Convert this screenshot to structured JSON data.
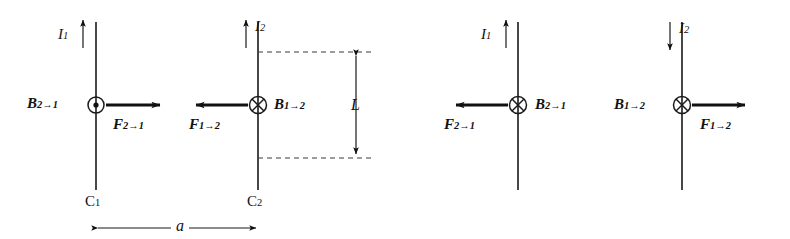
{
  "figure": {
    "background_color": "#ffffff",
    "ink_color": "#111111",
    "dash_color": "#3a3a3a"
  },
  "panels": [
    {
      "id": "parallel-currents",
      "description": "Two wires carrying currents in the same direction attract each other",
      "wires": [
        {
          "id": "wire-c1",
          "conductor_label": "C",
          "conductor_sub": "1",
          "current_label": "I",
          "current_sub": "1",
          "current_direction": "up",
          "field_symbol": "dot-out-of-page",
          "b_label": "B",
          "b_sub": "2→1",
          "b_side": "left",
          "f_label": "F",
          "f_sub": "2→1",
          "force_direction": "right"
        },
        {
          "id": "wire-c2",
          "conductor_label": "C",
          "conductor_sub": "2",
          "current_label": "I",
          "current_sub": "2",
          "current_direction": "up",
          "field_symbol": "cross-into-page",
          "b_label": "B",
          "b_sub": "1→2",
          "b_side": "right",
          "f_label": "F",
          "f_sub": "1→2",
          "force_direction": "left"
        }
      ],
      "dimensions": [
        {
          "id": "separation",
          "label": "a",
          "orientation": "horizontal"
        },
        {
          "id": "length",
          "label": "L",
          "orientation": "vertical"
        }
      ]
    },
    {
      "id": "antiparallel-currents",
      "description": "Two wires carrying currents in opposite directions repel each other",
      "wires": [
        {
          "id": "wire-3",
          "current_label": "I",
          "current_sub": "1",
          "current_direction": "up",
          "field_symbol": "cross-into-page",
          "b_label": "B",
          "b_sub": "2→1",
          "b_side": "right",
          "f_label": "F",
          "f_sub": "2→1",
          "force_direction": "left"
        },
        {
          "id": "wire-4",
          "current_label": "I",
          "current_sub": "2",
          "current_direction": "down",
          "field_symbol": "cross-into-page",
          "b_label": "B",
          "b_sub": "1→2",
          "b_side": "left",
          "f_label": "F",
          "f_sub": "1→2",
          "force_direction": "right"
        }
      ]
    }
  ],
  "labels": {
    "I": "I",
    "B": "B",
    "F": "F",
    "C": "C",
    "one": "1",
    "two": "2",
    "sep": "a",
    "len": "L",
    "s_2to1": "2→1",
    "s_1to2": "1→2",
    "arrow_up": "↑",
    "arrow_down": "↓"
  }
}
